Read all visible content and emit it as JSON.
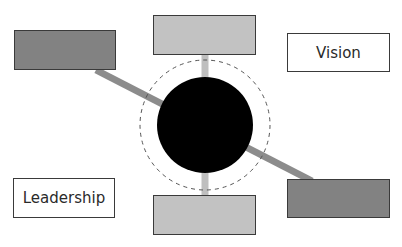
{
  "diagram": {
    "colors": {
      "dark_box": "#828282",
      "light_box": "#c2c2c2",
      "diagonal_connector": "#8c8c8c",
      "vertical_connector": "#bfbfbf",
      "hub": "#000000",
      "label_box": "#ffffff",
      "border": "#3a3a3a"
    },
    "hub": {
      "cx": 205,
      "cy": 125,
      "r": 48,
      "dashed_ring_r": 65
    },
    "boxes": [
      {
        "id": "top-left",
        "label": "",
        "fill": "dark"
      },
      {
        "id": "top-center",
        "label": "",
        "fill": "light"
      },
      {
        "id": "vision",
        "label": "Vision",
        "fill": "white"
      },
      {
        "id": "leadership",
        "label": "Leadership",
        "fill": "white"
      },
      {
        "id": "bottom-center",
        "label": "",
        "fill": "light"
      },
      {
        "id": "bottom-right",
        "label": "",
        "fill": "dark"
      }
    ]
  }
}
